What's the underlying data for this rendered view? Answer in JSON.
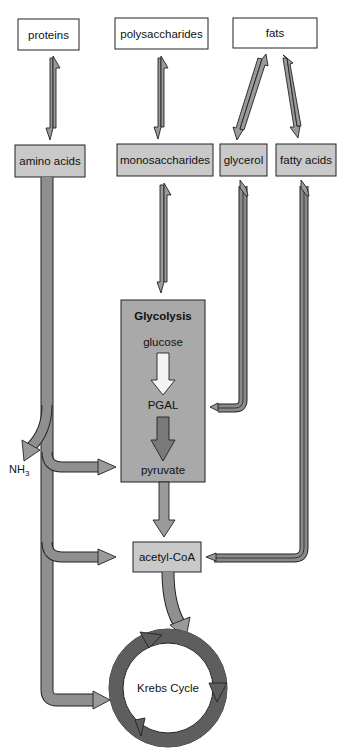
{
  "diagram": {
    "sources": [
      {
        "id": "proteins",
        "label": "proteins"
      },
      {
        "id": "polysaccharides",
        "label": "polysaccharides"
      },
      {
        "id": "fats",
        "label": "fats"
      }
    ],
    "monomers": [
      {
        "id": "amino_acids",
        "label": "amino acids"
      },
      {
        "id": "monosaccharides",
        "label": "monosaccharides"
      },
      {
        "id": "glycerol",
        "label": "glycerol"
      },
      {
        "id": "fatty_acids",
        "label": "fatty acids"
      }
    ],
    "glycolysis": {
      "title": "Glycolysis",
      "steps": [
        "glucose",
        "PGAL",
        "pyruvate"
      ]
    },
    "byproduct": {
      "label": "NH",
      "subscript": "3"
    },
    "acetyl_coa": {
      "label": "acetyl-CoA"
    },
    "krebs": {
      "label": "Krebs Cycle"
    },
    "edges": [
      {
        "from": "proteins",
        "to": "amino_acids",
        "type": "reversible"
      },
      {
        "from": "polysaccharides",
        "to": "monosaccharides",
        "type": "reversible"
      },
      {
        "from": "fats",
        "to": "glycerol",
        "type": "reversible"
      },
      {
        "from": "fats",
        "to": "fatty_acids",
        "type": "reversible"
      },
      {
        "from": "monosaccharides",
        "to": "glycolysis",
        "type": "reversible"
      },
      {
        "from": "glycerol",
        "to": "PGAL",
        "type": "reversible"
      },
      {
        "from": "glucose",
        "to": "PGAL",
        "type": "forward"
      },
      {
        "from": "PGAL",
        "to": "pyruvate",
        "type": "forward"
      },
      {
        "from": "amino_acids",
        "to": "NH3",
        "type": "forward"
      },
      {
        "from": "amino_acids",
        "to": "pyruvate",
        "type": "forward"
      },
      {
        "from": "amino_acids",
        "to": "acetyl_coa",
        "type": "forward"
      },
      {
        "from": "amino_acids",
        "to": "krebs",
        "type": "forward"
      },
      {
        "from": "pyruvate",
        "to": "acetyl_coa",
        "type": "forward"
      },
      {
        "from": "fatty_acids",
        "to": "acetyl_coa",
        "type": "reversible"
      },
      {
        "from": "acetyl_coa",
        "to": "krebs",
        "type": "forward"
      }
    ],
    "colors": {
      "source_fill": "#ffffff",
      "monomer_fill": "#c9c9c9",
      "glycolysis_fill": "#a9a9a9",
      "arrow_light": "#9a9a9a",
      "arrow_dark": "#7a7a7a",
      "krebs_ring": "#5e5e5e"
    }
  }
}
